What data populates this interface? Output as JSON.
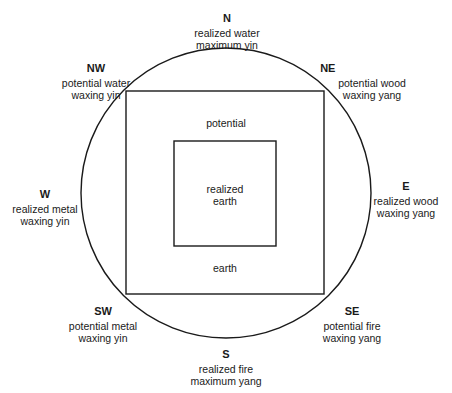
{
  "diagram": {
    "type": "circle-square-compass",
    "stroke_color": "#1a1a1a",
    "background": "#ffffff",
    "circle": {
      "cx": 226,
      "cy": 193,
      "r": 145
    },
    "outer_square": {
      "x": 126,
      "y": 91,
      "width": 198,
      "height": 203
    },
    "inner_square": {
      "x": 174,
      "y": 141,
      "width": 102,
      "height": 105
    }
  },
  "directions": {
    "N": {
      "dir": "N",
      "line1": "realized water",
      "line2": "maximum yin"
    },
    "NE": {
      "dir": "NE",
      "line1": "potential wood",
      "line2": "waxing yang"
    },
    "E": {
      "dir": "E",
      "line1": "realized wood",
      "line2": "waxing yang"
    },
    "SE": {
      "dir": "SE",
      "line1": "potential fire",
      "line2": "waxing yang"
    },
    "S": {
      "dir": "S",
      "line1": "realized fire",
      "line2": "maximum yang"
    },
    "SW": {
      "dir": "SW",
      "line1": "potential metal",
      "line2": "waxing yin"
    },
    "W": {
      "dir": "W",
      "line1": "realized metal",
      "line2": "waxing yin"
    },
    "NW": {
      "dir": "NW",
      "line1": "potential water",
      "line2": "waxing yin"
    }
  },
  "center": {
    "outer_top": "potential",
    "outer_bottom": "earth",
    "inner_line1": "realized",
    "inner_line2": "earth"
  }
}
